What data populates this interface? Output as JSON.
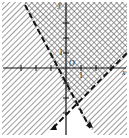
{
  "graph": {
    "title": "System of linear inequalities",
    "axes": {
      "x_label": "x",
      "y_label": "y",
      "origin_label": "O",
      "unit_x_label": "1",
      "unit_y_label": "1"
    },
    "lines": [
      {
        "name": "line-1",
        "style": "dashed",
        "slope": "negative",
        "from": [
          25,
          5
        ],
        "to": [
          90,
          128
        ]
      },
      {
        "name": "line-2",
        "style": "dashed",
        "slope": "positive",
        "from": [
          53,
          128
        ],
        "to": [
          127,
          53
        ]
      }
    ],
    "regions": {
      "solution": "cross-hatched region above both lines",
      "excluded": "white region below both lines"
    },
    "colors": {
      "line": "#111111",
      "hatch": "#555555",
      "background": "#ffffff"
    }
  }
}
